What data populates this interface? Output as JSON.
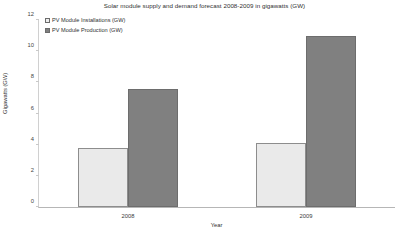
{
  "chart_data": {
    "type": "bar",
    "title": "Solar module supply and demand forecast 2008-2009 in gigawatts (GW)",
    "xlabel": "Year",
    "ylabel": "Gigawatts (GW)",
    "categories": [
      "2008",
      "2009"
    ],
    "series": [
      {
        "name": "PV Module Installations (GW)",
        "values": [
          3.8,
          4.1
        ],
        "color": "#eaeaea"
      },
      {
        "name": "PV Module Production (GW)",
        "values": [
          7.6,
          11.0
        ],
        "color": "#808080"
      }
    ],
    "ylim": [
      0,
      12
    ],
    "yticks": [
      0,
      2,
      4,
      6,
      8,
      10,
      12
    ],
    "ytick_labels": [
      "0",
      "2",
      "4",
      "6",
      "8",
      "10",
      "12"
    ],
    "grid": false,
    "legend_position": "top-left"
  }
}
